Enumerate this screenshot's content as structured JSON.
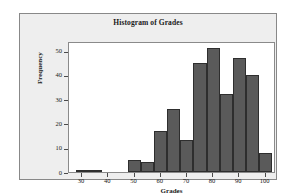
{
  "figure": {
    "background_color": "#ffffff",
    "panel_color": "#eeeeee",
    "panel_border_color": "#888888",
    "plot_background_color": "#ffffff",
    "plot_border_color": "#8a8a8a"
  },
  "chart_data": {
    "type": "bar",
    "title": "Histogram of Grades",
    "xlabel": "Grades",
    "ylabel": "Frequency",
    "bin_width": 5,
    "bin_edges": [
      27.5,
      32.5,
      37.5,
      42.5,
      47.5,
      52.5,
      57.5,
      62.5,
      67.5,
      72.5,
      77.5,
      82.5,
      87.5,
      92.5,
      97.5,
      102.5
    ],
    "bin_centers": [
      30,
      35,
      40,
      45,
      50,
      55,
      60,
      65,
      70,
      75,
      80,
      85,
      90,
      95,
      100
    ],
    "categories": [
      "27.5-32.5",
      "32.5-37.5",
      "37.5-42.5",
      "42.5-47.5",
      "47.5-52.5",
      "52.5-57.5",
      "57.5-62.5",
      "62.5-67.5",
      "67.5-72.5",
      "72.5-77.5",
      "77.5-82.5",
      "82.5-87.5",
      "87.5-92.5",
      "92.5-97.5",
      "97.5-102.5"
    ],
    "values": [
      1,
      1,
      0,
      0,
      5,
      4,
      17,
      26,
      13,
      45,
      51,
      32,
      47,
      40,
      8
    ],
    "xlim": [
      25,
      104
    ],
    "ylim": [
      0,
      54
    ],
    "xticks": [
      30,
      40,
      50,
      60,
      70,
      80,
      90,
      100
    ],
    "xtick_labels": [
      "30",
      "40",
      "50",
      "60",
      "70",
      "80",
      "90",
      "100"
    ],
    "yticks": [
      0,
      10,
      20,
      30,
      40,
      50
    ],
    "ytick_labels": [
      "0",
      "10",
      "20",
      "30",
      "40",
      "50"
    ],
    "grid": false,
    "legend": null,
    "bar_fill_color": "#5a5a5a",
    "bar_edge_color": "#2e2e2e"
  }
}
